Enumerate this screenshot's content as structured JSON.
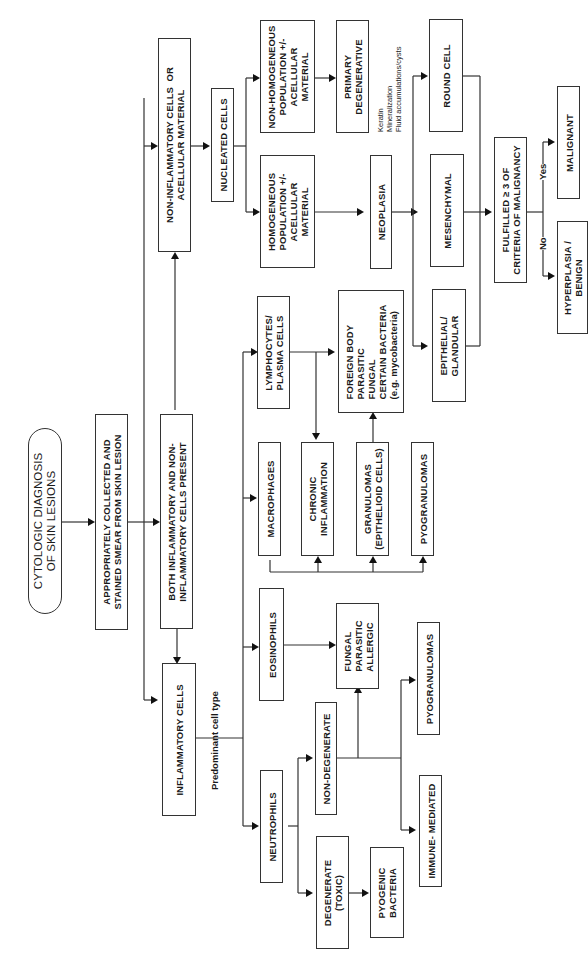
{
  "diagram": {
    "title": "CYTOLOGIC DIAGNOSIS\nOF SKIN LESIONS",
    "orientation": "rotated 90deg counter-clockwise",
    "nodes": {
      "start": "CYTOLOGIC DIAGNOSIS\nOF SKIN LESIONS",
      "smear": "APPROPRIATELY COLLECTED AND\nSTAINED SMEAR FROM SKIN LESION",
      "both": "BOTH INFLAMMATORY AND NON-\nINFLAMMATORY CELLS PRESENT",
      "inflammatory": "INFLAMMATORY CELLS",
      "non_inflammatory": "NON-INFLAMMATORY CELLS  OR\nACELLULAR MATERIAL",
      "nucleated": "NUCLEATED CELLS",
      "non_homogeneous": "NON-HOMOGENEOUS\nPOPULATION +/-\nACELLULAR\nMATERIAL",
      "homogeneous": "HOMOGENEOUS\nPOPULATION +/-\nACELLULAR\nMATERIAL",
      "primary_degenerative": "PRIMARY\nDEGENERATIVE",
      "neoplasia": "NEOPLASIA",
      "round_cell": "ROUND CELL",
      "mesenchymal": "MESENCHYMAL",
      "epithelial": "EPITHELIAL/\nGLANDULAR",
      "criteria": "FULFILLED ≥ 3 OF\nCRITERIA OF MALIGNANCY",
      "malignant": "MALIGNANT",
      "hyperplasia": "HYPERPLASIA /\nBENIGN",
      "neutrophils": "NEUTROPHILS",
      "eosinophils": "EOSINOPHILS",
      "macrophages": "MACROPHAGES",
      "lymphocytes": "LYMPHOCYTES/\nPLASMA CELLS",
      "degenerate": "DEGENERATE\n(TOXIC)",
      "non_degenerate": "NON-DEGENERATE",
      "pyogenic_bacteria": "PYOGENIC\nBACTERIA",
      "immune_mediated": "IMMUNE- MEDIATED",
      "pyogranulomas_lower": "PYOGRANULOMAS",
      "fungal_parasitic_allergic": "FUNGAL\nPARASITIC\nALLERGIC",
      "chronic_inflammation": "CHRONIC\nINFLAMMATION",
      "granulomas": "GRANULOMAS\n(EPITHELIOID CELLS)",
      "pyogranulomas_upper": "PYOGRANULOMAS",
      "foreign_body": "FOREIGN BODY\nPARASITIC\nFUNGAL\nCERTAIN BACTERIA\n(e.g. mycobacteria)"
    },
    "annotations": {
      "predominant": "Predominant cell type",
      "degenerative_list": "Keratin\nMineralization\nFluid accumulations/cysts",
      "yes": "Yes",
      "no": "No"
    }
  }
}
